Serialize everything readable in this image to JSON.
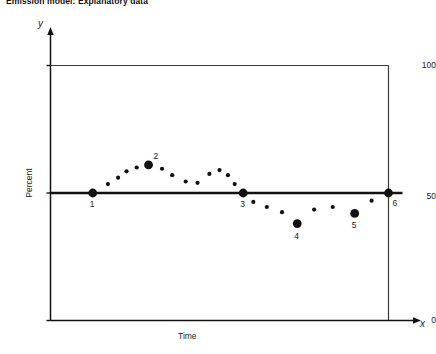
{
  "title": "Emission model: Explanatory data",
  "axis_letters": {
    "y": "y",
    "x": "x"
  },
  "chart_data": {
    "type": "scatter",
    "title": "Emission model: Explanatory data",
    "xlabel": "Time",
    "ylabel": "Percent",
    "xlim": [
      0,
      100
    ],
    "ylim": [
      0,
      100
    ],
    "grid": false,
    "legend": null,
    "y_ticks": [
      {
        "label": "100",
        "value": 100
      },
      {
        "label": "50",
        "value": 50
      },
      {
        "label": "0",
        "value": 0
      }
    ],
    "x_ticks": [],
    "reference_line": {
      "name": "baseline",
      "orientation": "horizontal",
      "value": 50,
      "color": "#111111",
      "width": 2.4
    },
    "labeled_points": [
      {
        "label": "1",
        "x": 12.5,
        "y": 50.0
      },
      {
        "label": "2",
        "x": 29.0,
        "y": 61.0
      },
      {
        "label": "3",
        "x": 57.0,
        "y": 50.0
      },
      {
        "label": "4",
        "x": 73.0,
        "y": 38.0
      },
      {
        "label": "5",
        "x": 90.0,
        "y": 42.0
      },
      {
        "label": "6",
        "x": 100.0,
        "y": 50.0
      }
    ],
    "small_points": [
      {
        "x": 17.0,
        "y": 53.5
      },
      {
        "x": 20.0,
        "y": 56.0
      },
      {
        "x": 22.5,
        "y": 58.5
      },
      {
        "x": 25.5,
        "y": 60.0
      },
      {
        "x": 33.0,
        "y": 59.5
      },
      {
        "x": 36.0,
        "y": 57.0
      },
      {
        "x": 40.0,
        "y": 54.5
      },
      {
        "x": 43.5,
        "y": 54.0
      },
      {
        "x": 47.0,
        "y": 57.5
      },
      {
        "x": 50.0,
        "y": 59.0
      },
      {
        "x": 52.5,
        "y": 57.0
      },
      {
        "x": 54.5,
        "y": 53.5
      },
      {
        "x": 60.0,
        "y": 46.5
      },
      {
        "x": 64.0,
        "y": 44.5
      },
      {
        "x": 68.5,
        "y": 42.5
      },
      {
        "x": 78.0,
        "y": 43.5
      },
      {
        "x": 83.5,
        "y": 44.5
      },
      {
        "x": 95.0,
        "y": 47.0
      }
    ],
    "marker_style": {
      "labeled_radius": 4.4,
      "small_radius": 2.1,
      "color": "#111111"
    },
    "frame": {
      "color": "#3a3a3a",
      "top": true,
      "right": true,
      "left": true,
      "bottom": true
    }
  }
}
